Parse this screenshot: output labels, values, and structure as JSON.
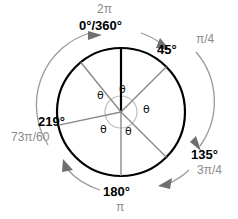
{
  "figure": {
    "type": "unit-circle-angle-diagram",
    "title_text": "",
    "center": {
      "x": 121,
      "y": 112
    },
    "radius": 64,
    "colors": {
      "circle_stroke": "#000000",
      "radius_gray": "#8a8a8a",
      "radius_black": "#000000",
      "arrow_arc": "#9a9a9a",
      "degree_text": "#000000",
      "radian_text": "#8a8a8a",
      "theta_text": "#111111",
      "background": "#ffffff"
    }
  },
  "labels": {
    "top": {
      "radian": "2π",
      "degree": "0°/360°"
    },
    "upper_right": {
      "degree": "45°",
      "radian": "π/4"
    },
    "lower_right": {
      "degree": "135°",
      "radian": "3π/4"
    },
    "bottom": {
      "degree": "180°",
      "radian": "π"
    },
    "left": {
      "degree": "219°",
      "radian": "73π/60"
    }
  },
  "theta_labels": [
    {
      "id": "theta-1",
      "text": "θ",
      "x": 119,
      "y": 84
    },
    {
      "id": "theta-2",
      "text": "θ",
      "x": 97,
      "y": 90
    },
    {
      "id": "theta-3",
      "text": "θ",
      "x": 143,
      "y": 104
    },
    {
      "id": "theta-4",
      "text": "θ",
      "x": 100,
      "y": 124
    },
    {
      "id": "theta-5",
      "text": "θ",
      "x": 125,
      "y": 126
    }
  ],
  "radii": [
    {
      "id": "radius-0deg",
      "angle_deg": 0,
      "color": "#000000",
      "width": 2.2
    },
    {
      "id": "radius-45deg",
      "angle_deg": 45,
      "color": "#8a8a8a",
      "width": 1.4
    },
    {
      "id": "radius-135deg",
      "angle_deg": 135,
      "color": "#8a8a8a",
      "width": 1.4
    },
    {
      "id": "radius-180deg",
      "angle_deg": 180,
      "color": "#8a8a8a",
      "width": 1.4
    },
    {
      "id": "radius-219deg",
      "angle_deg": 219,
      "color": "#8a8a8a",
      "width": 1.4
    }
  ],
  "chart_data": {
    "type": "scatter",
    "xlabel": "",
    "ylabel": "",
    "categories": [
      "0°/360°",
      "45°",
      "135°",
      "180°",
      "219°"
    ],
    "series": [
      {
        "name": "degrees",
        "values": [
          0,
          45,
          135,
          180,
          219
        ]
      },
      {
        "name": "radians",
        "values": [
          "2π",
          "π/4",
          "3π/4",
          "π",
          "73π/60"
        ]
      }
    ],
    "annotations": [
      "θ",
      "θ",
      "θ",
      "θ",
      "θ"
    ],
    "legend_position": "none",
    "grid": false
  }
}
